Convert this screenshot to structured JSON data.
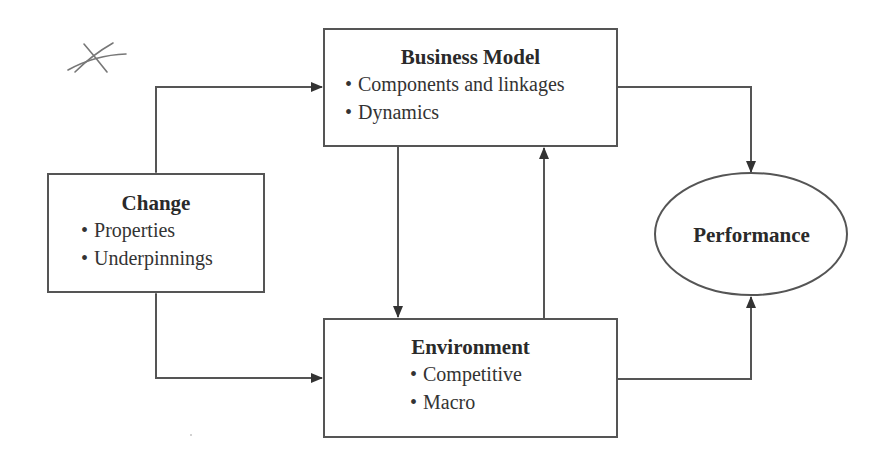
{
  "diagram": {
    "nodes": {
      "business_model": {
        "title": "Business Model",
        "bullets": [
          "Components and linkages",
          "Dynamics"
        ]
      },
      "change": {
        "title": "Change",
        "bullets": [
          "Properties",
          "Underpinnings"
        ]
      },
      "environment": {
        "title": "Environment",
        "bullets": [
          "Competitive",
          "Macro"
        ]
      },
      "performance": {
        "title": "Performance",
        "shape": "ellipse"
      }
    },
    "edges": [
      {
        "from": "change",
        "to": "business_model",
        "direction": "bidirectional"
      },
      {
        "from": "change",
        "to": "environment",
        "direction": "bidirectional"
      },
      {
        "from": "business_model",
        "to": "environment",
        "direction": "forward"
      },
      {
        "from": "environment",
        "to": "business_model",
        "direction": "forward"
      },
      {
        "from": "business_model",
        "to": "performance",
        "direction": "forward"
      },
      {
        "from": "environment",
        "to": "performance",
        "direction": "forward"
      }
    ],
    "annotation": "hand-drawn-x-mark",
    "colors": {
      "line": "#555555",
      "text": "#2b2b2b",
      "background": "#ffffff"
    }
  }
}
